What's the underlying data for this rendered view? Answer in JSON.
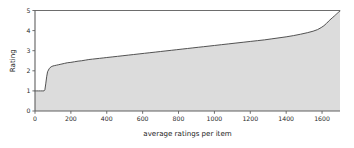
{
  "chart_data": {
    "type": "area",
    "title": "",
    "subtitle": "",
    "xlabel": "average ratings per item",
    "ylabel": "Rating",
    "xlim": [
      0,
      1700
    ],
    "ylim": [
      0,
      5
    ],
    "grid": false,
    "legend": null,
    "legend_position": "none",
    "xticks": [
      0,
      200,
      400,
      600,
      800,
      1000,
      1200,
      1400,
      1600
    ],
    "xtick_labels": [
      "0",
      "200",
      "400",
      "600",
      "800",
      "1000",
      "1200",
      "1400",
      "1600"
    ],
    "yticks": [
      0,
      1,
      2,
      3,
      4,
      5
    ],
    "ytick_labels": [
      "0",
      "1",
      "2",
      "3",
      "4",
      "5"
    ],
    "annotations": [
      "horizontal reference line drawn at Rating = 5 across full x range"
    ],
    "colors": {
      "fill": "#dcdcdc",
      "line": "#4a4a4a",
      "axis": "#606060",
      "text": "#1c1c1c",
      "background": "#ffffff",
      "reference_line": "#6d6d6d"
    },
    "series": [
      {
        "name": "Rating",
        "description": "monotonically non-decreasing sorted rating curve",
        "x": [
          0,
          10,
          20,
          30,
          40,
          50,
          55,
          60,
          65,
          70,
          80,
          90,
          100,
          110,
          120,
          130,
          140,
          150,
          165,
          180,
          200,
          220,
          240,
          260,
          280,
          300,
          320,
          340,
          360,
          380,
          400,
          430,
          460,
          490,
          520,
          550,
          580,
          610,
          640,
          670,
          700,
          730,
          760,
          790,
          820,
          850,
          880,
          910,
          940,
          970,
          1000,
          1040,
          1080,
          1120,
          1160,
          1200,
          1240,
          1280,
          1320,
          1360,
          1400,
          1440,
          1480,
          1520,
          1550,
          1575,
          1595,
          1610,
          1625,
          1640,
          1650,
          1660,
          1668,
          1675,
          1680,
          1685,
          1690,
          1695,
          1700
        ],
        "y": [
          1.0,
          1.0,
          1.0,
          1.0,
          1.0,
          1.0,
          1.05,
          1.35,
          1.7,
          1.95,
          2.12,
          2.2,
          2.24,
          2.26,
          2.28,
          2.3,
          2.32,
          2.34,
          2.37,
          2.4,
          2.42,
          2.45,
          2.48,
          2.5,
          2.53,
          2.56,
          2.58,
          2.6,
          2.62,
          2.64,
          2.66,
          2.69,
          2.72,
          2.75,
          2.78,
          2.81,
          2.84,
          2.87,
          2.9,
          2.93,
          2.96,
          2.99,
          3.02,
          3.05,
          3.08,
          3.11,
          3.14,
          3.17,
          3.2,
          3.23,
          3.26,
          3.3,
          3.34,
          3.38,
          3.42,
          3.46,
          3.5,
          3.54,
          3.59,
          3.64,
          3.69,
          3.75,
          3.82,
          3.9,
          3.97,
          4.05,
          4.15,
          4.24,
          4.36,
          4.5,
          4.58,
          4.66,
          4.72,
          4.78,
          4.82,
          4.86,
          4.9,
          4.94,
          4.97
        ]
      }
    ]
  }
}
